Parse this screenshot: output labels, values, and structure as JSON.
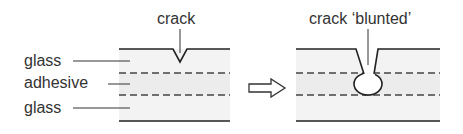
{
  "labels": {
    "crack": "crack",
    "crack_blunted": "crack ‘blunted’",
    "glass_top": "glass",
    "adhesive": "adhesive",
    "glass_bottom": "glass"
  },
  "icons": {
    "transition_arrow": "right-arrow-outline"
  },
  "colors": {
    "line": "#222222",
    "fill_glass": "#f2f2f2",
    "fill_adhesive": "#eeeeee",
    "dash": "#444444",
    "text": "#333333"
  }
}
